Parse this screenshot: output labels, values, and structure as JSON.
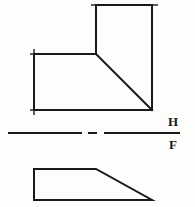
{
  "drawing": {
    "title": "Orthographic projection - top and front views",
    "background_color": "#fdfdfc",
    "line_color": "#1a1a1a",
    "canvas": {
      "width": 195,
      "height": 207
    },
    "top_view": {
      "name": "top-view",
      "description": "L-shaped plan view with chamfered inner corner",
      "points": "96,5 152,5 152,110 34,110 34,54 96,54 96,5",
      "diagonal": {
        "x1": 96,
        "y1": 54,
        "x2": 152,
        "y2": 110
      },
      "corner_ticks": [
        {
          "x1": 30,
          "y1": 54,
          "x2": 40,
          "y2": 54
        },
        {
          "x1": 34,
          "y1": 50,
          "x2": 34,
          "y2": 60
        },
        {
          "x1": 30,
          "y1": 110,
          "x2": 40,
          "y2": 110
        },
        {
          "x1": 34,
          "y1": 104,
          "x2": 34,
          "y2": 114
        },
        {
          "x1": 148,
          "y1": 5,
          "x2": 157,
          "y2": 5
        },
        {
          "x1": 92,
          "y1": 5,
          "x2": 100,
          "y2": 5
        }
      ]
    },
    "front_view": {
      "name": "front-view",
      "description": "Trapezoid elevation with sloped right face",
      "points": "34,169 96,169 152,200 34,200 34,169",
      "corner_ticks": []
    },
    "fold_line": {
      "name": "hf-fold-line",
      "y": 133,
      "segments": [
        {
          "x1": 8,
          "y1": 133,
          "x2": 82,
          "y2": 133
        },
        {
          "x1": 88,
          "y1": 133,
          "x2": 97,
          "y2": 133
        },
        {
          "x1": 104,
          "y1": 133,
          "x2": 180,
          "y2": 133
        }
      ],
      "upper_label": "H",
      "lower_label": "F",
      "upper_label_pos": {
        "x": 173,
        "y": 123
      },
      "lower_label_pos": {
        "x": 173,
        "y": 145
      }
    }
  }
}
